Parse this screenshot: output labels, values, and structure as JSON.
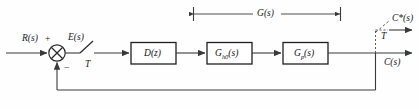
{
  "diagram": {
    "type": "control-block-diagram",
    "background_color": "#fefefe",
    "line_color": "#3a3a3a",
    "text_color": "#1a1a1a",
    "signals": {
      "input": "R(s)",
      "error": "E(s)",
      "output": "C(s)",
      "sampled_output": "C*(s)",
      "sampler_period_input": "T",
      "sampler_period_output": "T",
      "plus_sign": "+",
      "minus_sign": "−"
    },
    "blocks": [
      {
        "id": "controller",
        "label_main": "D",
        "label_arg": "(z)",
        "subscript": ""
      },
      {
        "id": "hold",
        "label_main": "G",
        "label_arg": "(s)",
        "subscript": "h0"
      },
      {
        "id": "plant",
        "label_main": "G",
        "label_arg": "(s)",
        "subscript": "p"
      }
    ],
    "span_annotation": {
      "label": "G(s)",
      "label_main": "G",
      "label_arg": "(s)"
    },
    "summing_junction": {
      "name": "summing-junction",
      "style": "circle-with-x"
    },
    "feedback": {
      "style": "unity-negative-feedback"
    }
  }
}
